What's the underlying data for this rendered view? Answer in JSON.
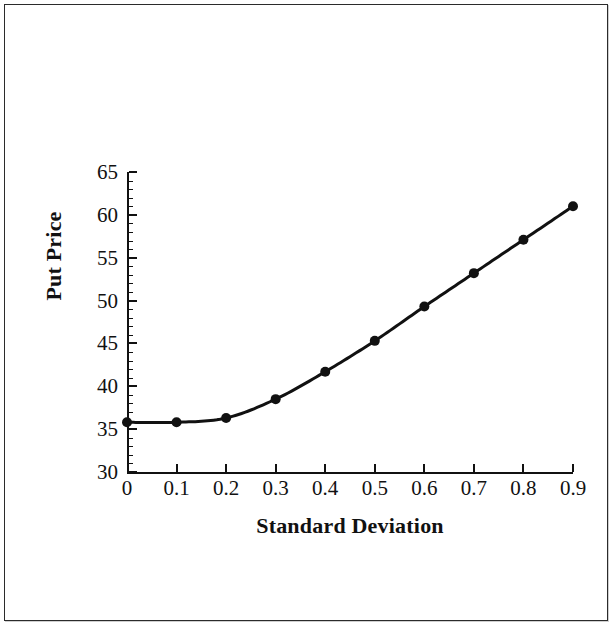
{
  "chart_data": {
    "type": "line",
    "title": "",
    "xlabel": "Standard Deviation",
    "ylabel": "Put Price",
    "x": [
      0.0,
      0.1,
      0.2,
      0.3,
      0.4,
      0.5,
      0.6,
      0.7,
      0.8,
      0.9
    ],
    "values": [
      35.8,
      35.8,
      36.3,
      38.5,
      41.7,
      45.3,
      49.3,
      53.2,
      57.1,
      61.0
    ],
    "series": [
      {
        "name": "Put Price",
        "values": [
          35.8,
          35.8,
          36.3,
          38.5,
          41.7,
          45.3,
          49.3,
          53.2,
          57.1,
          61.0
        ]
      }
    ],
    "xlim": [
      0.0,
      0.9
    ],
    "ylim": [
      30,
      65
    ],
    "xticks": [
      0.0,
      0.1,
      0.2,
      0.3,
      0.4,
      0.5,
      0.6,
      0.7,
      0.8,
      0.9
    ],
    "xtick_labels": [
      "0",
      "0.1",
      "0.2",
      "0.3",
      "0.4",
      "0.5",
      "0.6",
      "0.7",
      "0.8",
      "0.9"
    ],
    "yticks": [
      30,
      35,
      40,
      45,
      50,
      55,
      60,
      65
    ],
    "ytick_labels": [
      "30",
      "35",
      "40",
      "45",
      "50",
      "55",
      "60",
      "65"
    ],
    "y_minor_tick_step": 1,
    "grid": false,
    "legend": false,
    "legend_position": "none",
    "marker": "filled-circle",
    "marker_color": "#111111",
    "line_color": "#111111",
    "line_width": 3,
    "background_color": "#ffffff",
    "frame_border_color": "#2b2b2b"
  }
}
